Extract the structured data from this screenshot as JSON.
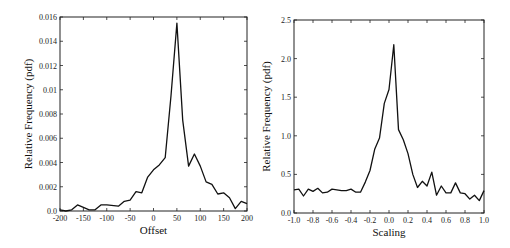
{
  "chart_data": [
    {
      "type": "line",
      "title": "",
      "xlabel": "Offset",
      "ylabel": "Relative Frequency (pdf)",
      "xlim": [
        -200,
        200
      ],
      "ylim": [
        0,
        0.016
      ],
      "xticks": [
        -200,
        -150,
        -100,
        -50,
        0,
        50,
        100,
        150,
        200
      ],
      "xtick_labels": [
        "-200",
        "-150",
        "-100",
        "-50",
        "0",
        "50",
        "100",
        "150",
        "200"
      ],
      "yticks": [
        0,
        0.002,
        0.004,
        0.006,
        0.008,
        0.01,
        0.012,
        0.014,
        0.016
      ],
      "ytick_labels": [
        "0.0",
        "0.002",
        "0.004",
        "0.006",
        "0.008",
        "0.01",
        "0.012",
        "0.014",
        "0.016"
      ],
      "grid": false,
      "x": [
        -200,
        -187.5,
        -175,
        -162.5,
        -150,
        -137.5,
        -125,
        -112.5,
        -100,
        -75,
        -62.5,
        -50,
        -37.5,
        -25,
        -12.5,
        0,
        12.5,
        25,
        37.5,
        50,
        62.5,
        75,
        87.5,
        100,
        112.5,
        125,
        137.5,
        150,
        162.5,
        175,
        187.5,
        200
      ],
      "y": [
        0.0001,
        0.0,
        0.0001,
        0.0005,
        0.0003,
        0.0001,
        0.0001,
        0.0005,
        0.0005,
        0.0004,
        0.0008,
        0.0009,
        0.0016,
        0.0015,
        0.0028,
        0.0034,
        0.0038,
        0.0044,
        0.0095,
        0.0155,
        0.0075,
        0.0037,
        0.0047,
        0.0037,
        0.0024,
        0.0022,
        0.0014,
        0.0015,
        0.0011,
        0.0002,
        0.0008,
        0.0006
      ]
    },
    {
      "type": "line",
      "title": "",
      "xlabel": "Scaling",
      "ylabel": "Relative Frequency (pdf)",
      "xlim": [
        -1.0,
        1.0
      ],
      "ylim": [
        0,
        2.5
      ],
      "xticks": [
        -1.0,
        -0.8,
        -0.6,
        -0.4,
        -0.2,
        0.0,
        0.2,
        0.4,
        0.6,
        0.8,
        1.0
      ],
      "xtick_labels": [
        "-1.0",
        "-0.8",
        "-0.6",
        "-0.4",
        "-0.2",
        "0.0",
        "0.2",
        "0.4",
        "0.6",
        "0.8",
        "1.0"
      ],
      "yticks": [
        0,
        0.5,
        1.0,
        1.5,
        2.0,
        2.5
      ],
      "ytick_labels": [
        "0.0",
        "0.5",
        "1.0",
        "1.5",
        "2.0",
        "2.5"
      ],
      "grid": false,
      "x": [
        -1.0,
        -0.95,
        -0.9,
        -0.85,
        -0.8,
        -0.75,
        -0.7,
        -0.65,
        -0.6,
        -0.55,
        -0.5,
        -0.45,
        -0.4,
        -0.35,
        -0.3,
        -0.25,
        -0.2,
        -0.15,
        -0.1,
        -0.05,
        0.0,
        0.05,
        0.1,
        0.15,
        0.2,
        0.25,
        0.3,
        0.35,
        0.4,
        0.45,
        0.5,
        0.55,
        0.6,
        0.65,
        0.7,
        0.75,
        0.8,
        0.85,
        0.9,
        0.95,
        1.0
      ],
      "y": [
        0.3,
        0.31,
        0.22,
        0.31,
        0.28,
        0.32,
        0.26,
        0.27,
        0.31,
        0.3,
        0.29,
        0.29,
        0.31,
        0.27,
        0.27,
        0.4,
        0.55,
        0.83,
        0.97,
        1.42,
        1.6,
        2.18,
        1.08,
        0.95,
        0.77,
        0.5,
        0.33,
        0.41,
        0.35,
        0.53,
        0.23,
        0.35,
        0.26,
        0.26,
        0.39,
        0.26,
        0.25,
        0.18,
        0.23,
        0.16,
        0.29
      ]
    }
  ],
  "plots": [
    {
      "frame": {
        "x0": 60,
        "x1": 247,
        "y0": 17,
        "y1": 211
      }
    },
    {
      "frame": {
        "x0": 294,
        "x1": 484,
        "y0": 20,
        "y1": 213
      }
    }
  ]
}
